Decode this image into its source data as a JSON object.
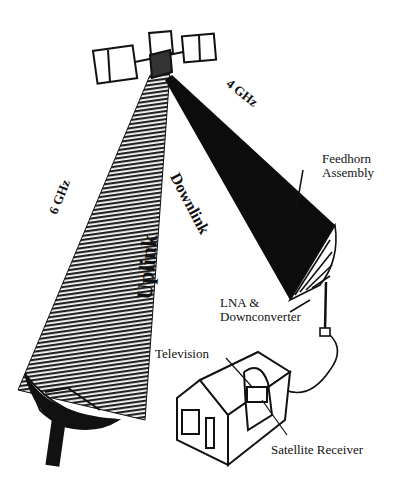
{
  "diagram": {
    "type": "satellite communication link",
    "labels": {
      "downlink_freq": "4 GHz",
      "downlink": "Downlink",
      "uplink_freq": "6 GHz",
      "uplink": "Uplink",
      "feedhorn_line1": "Feedhorn",
      "feedhorn_line2": "Assembly",
      "lna_line1": "LNA &",
      "lna_line2": "Downconverter",
      "television": "Television",
      "satellite_receiver": "Satellite Receiver"
    },
    "colors": {
      "ink": "#111111",
      "background": "#ffffff",
      "uplink_beam": "#555555"
    }
  }
}
